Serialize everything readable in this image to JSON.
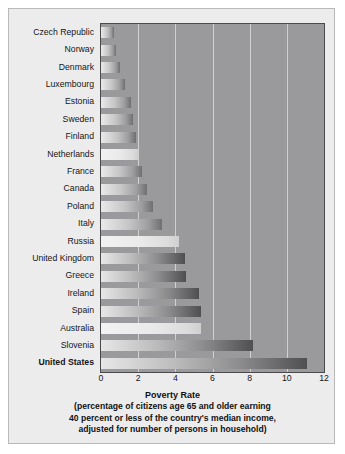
{
  "chart_data": {
    "type": "bar",
    "orientation": "horizontal",
    "title": "Poverty Rate",
    "subtitle_lines": [
      "(percentage of citizens age 65 and older earning",
      "40 percent or less of the country's median income,",
      "adjusted for number of persons in household)"
    ],
    "xlabel": "Poverty Rate",
    "ylabel": "",
    "xlim": [
      0,
      12
    ],
    "xticks": [
      0,
      2,
      4,
      6,
      8,
      10,
      12
    ],
    "xtick_labels": [
      "0",
      "2",
      "4",
      "6",
      "8",
      "10",
      "12"
    ],
    "grid": "vertical",
    "legend": "none",
    "categories": [
      "Czech Republic",
      "Norway",
      "Denmark",
      "Luxembourg",
      "Estonia",
      "Sweden",
      "Finland",
      "Netherlands",
      "France",
      "Canada",
      "Poland",
      "Italy",
      "Russia",
      "United Kingdom",
      "Greece",
      "Ireland",
      "Spain",
      "Australia",
      "Slovenia",
      "United States"
    ],
    "values": [
      0.7,
      0.8,
      1.0,
      1.3,
      1.6,
      1.7,
      1.9,
      2.0,
      2.2,
      2.5,
      2.8,
      3.3,
      4.2,
      4.5,
      4.6,
      5.3,
      5.4,
      5.4,
      8.2,
      11.1
    ],
    "highlighted": [
      "United States"
    ],
    "colors": {
      "plot_background": "#9a9a9c",
      "figure_background": "#ececed",
      "gridline": "#d9d9da",
      "bar_light": "#e9e9ea",
      "bar_dark": "#6f6f71",
      "text": "#161616"
    }
  }
}
